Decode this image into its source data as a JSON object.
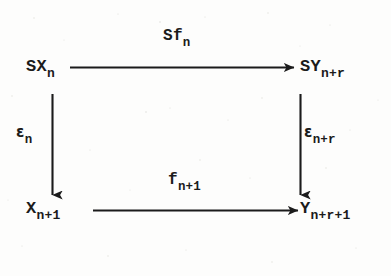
{
  "diagram": {
    "kind": "commutative-diagram",
    "ink_color": "#1b1b1b",
    "background_color": "#fdfdfc",
    "nodes": [
      {
        "id": "top-left",
        "base": "SX",
        "subscript": "n",
        "full": "SX_n"
      },
      {
        "id": "top-right",
        "base": "SY",
        "subscript": "n+r",
        "full": "SY_{n+r}"
      },
      {
        "id": "bottom-left",
        "base": "X",
        "subscript": "n+1",
        "full": "X_{n+1}"
      },
      {
        "id": "bottom-right",
        "base": "Y",
        "subscript": "n+r+1",
        "full": "Y_{n+r+1}"
      }
    ],
    "arrows": [
      {
        "id": "top-horizontal",
        "from": "SX_n",
        "to": "SY_{n+r}",
        "direction": "right",
        "label_base": "Sf",
        "label_subscript": "n",
        "label_full": "Sf_n"
      },
      {
        "id": "bottom-horizontal",
        "from": "X_{n+1}",
        "to": "Y_{n+r+1}",
        "direction": "right",
        "label_base": "f",
        "label_subscript": "n+1",
        "label_full": "f_{n+1}"
      },
      {
        "id": "left-vertical",
        "from": "SX_n",
        "to": "X_{n+1}",
        "direction": "down",
        "label_base": "ε",
        "label_subscript": "n",
        "label_full": "ε_n"
      },
      {
        "id": "right-vertical",
        "from": "SY_{n+r}",
        "to": "Y_{n+r+1}",
        "direction": "down",
        "label_base": "ε",
        "label_subscript": "n+r",
        "label_full": "ε_{n+r}"
      }
    ]
  }
}
